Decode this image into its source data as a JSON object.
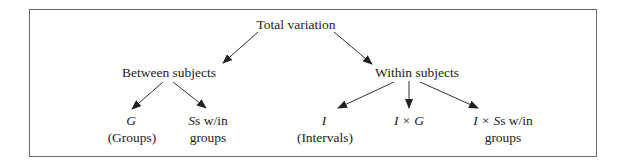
{
  "diagram": {
    "colors": {
      "line": "#333333",
      "text": "#222222",
      "border": "#6a6a6a"
    },
    "nodes": {
      "root": {
        "label": "Total variation"
      },
      "between": {
        "label": "Between subjects"
      },
      "within": {
        "label": "Within subjects"
      },
      "groups": {
        "symbol": "G",
        "label": "(Groups)"
      },
      "ss_within_groups": {
        "symbol": "S",
        "label_line1_suffix": "s w/in",
        "label_line2": "groups"
      },
      "intervals": {
        "symbol": "I",
        "label": "(Intervals)"
      },
      "i_by_g": {
        "symbol": "I × G"
      },
      "i_by_ss": {
        "symbol": "I × S",
        "label_line1_suffix": "s w/in",
        "label_line2": "groups"
      }
    },
    "edges": [
      {
        "from": "Total variation",
        "to": "Between subjects"
      },
      {
        "from": "Total variation",
        "to": "Within subjects"
      },
      {
        "from": "Between subjects",
        "to": "G (Groups)"
      },
      {
        "from": "Between subjects",
        "to": "Ss w/in groups"
      },
      {
        "from": "Within subjects",
        "to": "I (Intervals)"
      },
      {
        "from": "Within subjects",
        "to": "I × G"
      },
      {
        "from": "Within subjects",
        "to": "I × Ss w/in groups"
      }
    ]
  }
}
